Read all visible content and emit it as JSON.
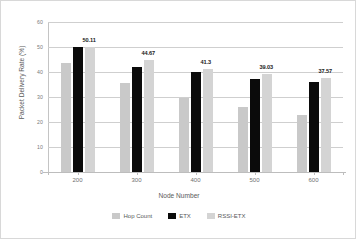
{
  "chart_data": {
    "type": "bar",
    "title": "",
    "xlabel": "Node Number",
    "ylabel": "Packet Delivery Rate (%)",
    "categories": [
      "200",
      "300",
      "400",
      "500",
      "600"
    ],
    "ylim": [
      0,
      60
    ],
    "yticks": [
      "0",
      "10",
      "20",
      "30",
      "40",
      "50",
      "60"
    ],
    "grid": true,
    "legend_position": "bottom",
    "series": [
      {
        "name": "Hop Count",
        "color": "#c9c9c9",
        "values": [
          43.5,
          35.8,
          29.8,
          26.0,
          23.0
        ]
      },
      {
        "name": "ETX",
        "color": "#0b0b0b",
        "values": [
          50.0,
          42.0,
          40.0,
          37.2,
          36.0
        ]
      },
      {
        "name": "RSSI-ETX",
        "color": "#d4d4d4",
        "values": [
          50.11,
          44.67,
          41.3,
          39.03,
          37.57
        ]
      }
    ],
    "annotations": [
      {
        "text": "50.11",
        "series": "RSSI-ETX",
        "category": "200"
      },
      {
        "text": "44.67",
        "series": "RSSI-ETX",
        "category": "300"
      },
      {
        "text": "41.3",
        "series": "RSSI-ETX",
        "category": "400"
      },
      {
        "text": "39.03",
        "series": "RSSI-ETX",
        "category": "500"
      },
      {
        "text": "37.57",
        "series": "RSSI-ETX",
        "category": "600"
      }
    ]
  }
}
